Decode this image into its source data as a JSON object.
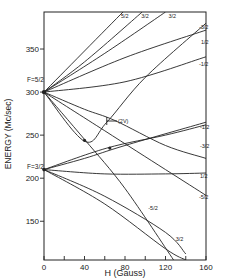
{
  "chart_data": {
    "type": "line",
    "title": "",
    "xlabel": "H (Gauss)",
    "ylabel": "ENERGY (Mc/sec)",
    "xlim": [
      0,
      160
    ],
    "ylim": [
      105,
      393
    ],
    "grid": false,
    "legend": "none",
    "x_ticks": [
      0,
      40,
      80,
      120,
      160
    ],
    "x_minor_ticks": [
      20,
      60,
      100,
      140
    ],
    "y_ticks": [
      150,
      200,
      250,
      300,
      350
    ],
    "annotations": [
      {
        "text": "F=5/2",
        "x": 0,
        "y": 312
      },
      {
        "text": "F=3/2",
        "x": 0,
        "y": 219
      },
      {
        "text": "(2V)",
        "x": 62,
        "y": 264
      },
      {
        "text": "5/2",
        "x": 76,
        "y": 386
      },
      {
        "text": "3/2",
        "x": 96,
        "y": 386
      },
      {
        "text": "3/2",
        "x": 123,
        "y": 386
      },
      {
        "text": "-3/2",
        "x": 153,
        "y": 373
      },
      {
        "text": "1/2",
        "x": 155,
        "y": 356
      },
      {
        "text": "-1/2",
        "x": 153,
        "y": 330
      },
      {
        "text": "-1/2",
        "x": 154,
        "y": 257
      },
      {
        "text": "-3/2",
        "x": 154,
        "y": 235
      },
      {
        "text": "1/2",
        "x": 154,
        "y": 200
      },
      {
        "text": "-5/2",
        "x": 153,
        "y": 176
      },
      {
        "text": "-5/2",
        "x": 103,
        "y": 163
      },
      {
        "text": "3/2",
        "x": 130,
        "y": 127
      }
    ],
    "series": [
      {
        "name": "F=5/2, m=5/2",
        "x": [
          0,
          78
        ],
        "y": [
          300,
          393
        ]
      },
      {
        "name": "F=5/2, m=3/2",
        "x": [
          0,
          40,
          97
        ],
        "y": [
          300,
          335,
          393
        ]
      },
      {
        "name": "F=5/2, m=3/2 (upper)",
        "x": [
          0,
          60,
          120
        ],
        "y": [
          300,
          345,
          393
        ]
      },
      {
        "name": "F=5/2, m=1/2",
        "x": [
          0,
          80,
          160
        ],
        "y": [
          300,
          340,
          372
        ]
      },
      {
        "name": "F=5/2, m=-1/2",
        "x": [
          0,
          80,
          160
        ],
        "y": [
          300,
          312,
          341
        ]
      },
      {
        "name": "F=5/2, m=-3/2",
        "x": [
          0,
          40,
          70,
          120,
          160
        ],
        "y": [
          300,
          280,
          267,
          238,
          223
        ]
      },
      {
        "name": "F=5/2, m=-5/2 (crossing)",
        "x": [
          0,
          40,
          80,
          128
        ],
        "y": [
          300,
          245,
          188,
          105
        ]
      },
      {
        "name": "F=5/2, m=-5/2",
        "x": [
          0,
          60,
          120,
          160
        ],
        "y": [
          300,
          255,
          210,
          180
        ]
      },
      {
        "name": "F=5/2, m=-3/2 (upper)",
        "x": [
          0,
          40,
          62,
          100,
          160
        ],
        "y": [
          300,
          243,
          265,
          317,
          380
        ]
      },
      {
        "name": "F=3/2, m=-1/2",
        "x": [
          0,
          40,
          80,
          160
        ],
        "y": [
          210,
          223,
          238,
          265
        ]
      },
      {
        "name": "F=3/2, m=1/2",
        "x": [
          0,
          60,
          120,
          160
        ],
        "y": [
          210,
          205,
          205,
          206
        ]
      },
      {
        "name": "F=3/2, m=3/2",
        "x": [
          0,
          60,
          120,
          140
        ],
        "y": [
          210,
          179,
          137,
          112
        ]
      },
      {
        "name": "F=3/2, m=-3/2",
        "x": [
          0,
          62,
          120,
          160
        ],
        "y": [
          210,
          235,
          250,
          262
        ]
      },
      {
        "name": "F=3/2, m=3/2 (lower)",
        "x": [
          0,
          60,
          120,
          140
        ],
        "y": [
          210,
          170,
          118,
          105
        ]
      }
    ]
  },
  "axes": {
    "x_label": "H (Gauss)",
    "y_label": "ENERGY (Mc/sec)",
    "x_tick_labels": [
      "0",
      "40",
      "80",
      "120",
      "160"
    ],
    "y_tick_labels": [
      "150",
      "200",
      "250",
      "300",
      "350"
    ],
    "f_upper_label": "F=5/2",
    "f_lower_label": "F=3/2",
    "marker_label": "(2V)"
  }
}
